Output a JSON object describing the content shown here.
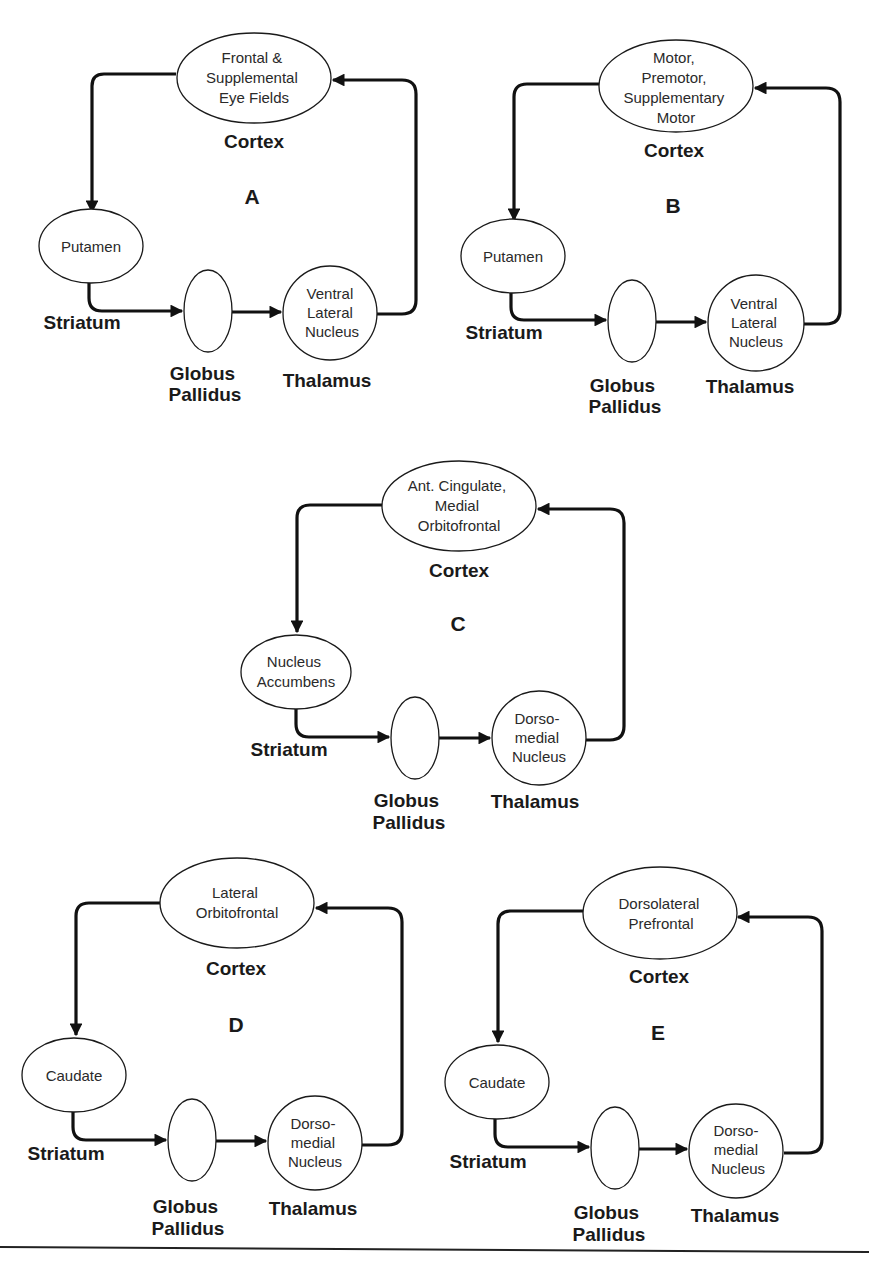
{
  "figure": {
    "common_labels": {
      "cortex": "Cortex",
      "striatum": "Striatum",
      "globus_line1": "Globus",
      "globus_line2": "Pallidus",
      "thalamus": "Thalamus"
    },
    "circuits": [
      {
        "id": "A",
        "letter": "A",
        "cortex_lines": [
          "Frontal &",
          "Supplemental",
          "Eye Fields"
        ],
        "striatum_lines": [
          "Putamen"
        ],
        "thalamus_lines": [
          "Ventral",
          "Lateral",
          "Nucleus"
        ]
      },
      {
        "id": "B",
        "letter": "B",
        "cortex_lines": [
          "Motor,",
          "Premotor,",
          "Supplementary",
          "Motor"
        ],
        "striatum_lines": [
          "Putamen"
        ],
        "thalamus_lines": [
          "Ventral",
          "Lateral",
          "Nucleus"
        ]
      },
      {
        "id": "C",
        "letter": "C",
        "cortex_lines": [
          "Ant. Cingulate,",
          "Medial",
          "Orbitofrontal"
        ],
        "striatum_lines": [
          "Nucleus",
          "Accumbens"
        ],
        "thalamus_lines": [
          "Dorso-",
          "medial",
          "Nucleus"
        ]
      },
      {
        "id": "D",
        "letter": "D",
        "cortex_lines": [
          "Lateral",
          "Orbitofrontal"
        ],
        "striatum_lines": [
          "Caudate"
        ],
        "thalamus_lines": [
          "Dorso-",
          "medial",
          "Nucleus"
        ]
      },
      {
        "id": "E",
        "letter": "E",
        "cortex_lines": [
          "Dorsolateral",
          "Prefrontal"
        ],
        "striatum_lines": [
          "Caudate"
        ],
        "thalamus_lines": [
          "Dorso-",
          "medial",
          "Nucleus"
        ]
      }
    ],
    "colors": {
      "line": "#111111",
      "node_stroke": "#1a1a1a",
      "background": "#ffffff"
    }
  }
}
